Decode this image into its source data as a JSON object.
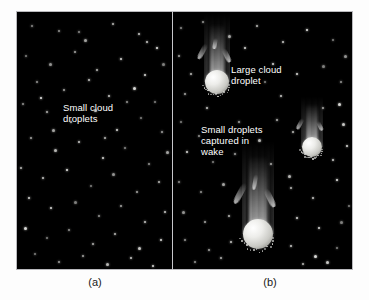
{
  "figure": {
    "background_color": "#fdfdfd",
    "panel_background_color": "#000000",
    "panel_border_color": "#b9b9bd",
    "droplet_color": "#ededea",
    "dot_color": "#e9e9e6",
    "label_color": "#ffffff",
    "caption_color": "#1a1a1a"
  },
  "panel_a": {
    "caption": "(a)",
    "label": "Small cloud\ndroplets",
    "dots": [
      [
        15,
        14
      ],
      [
        42,
        19
      ],
      [
        68,
        28
      ],
      [
        96,
        12
      ],
      [
        122,
        22
      ],
      [
        140,
        36
      ],
      [
        9,
        44
      ],
      [
        33,
        52
      ],
      [
        58,
        40
      ],
      [
        80,
        58
      ],
      [
        104,
        47
      ],
      [
        128,
        63
      ],
      [
        146,
        52
      ],
      [
        20,
        70
      ],
      [
        47,
        78
      ],
      [
        72,
        68
      ],
      [
        92,
        84
      ],
      [
        117,
        76
      ],
      [
        138,
        90
      ],
      [
        6,
        92
      ],
      [
        30,
        100
      ],
      [
        54,
        110
      ],
      [
        78,
        98
      ],
      [
        100,
        118
      ],
      [
        124,
        106
      ],
      [
        145,
        120
      ],
      [
        14,
        126
      ],
      [
        38,
        138
      ],
      [
        62,
        130
      ],
      [
        86,
        146
      ],
      [
        108,
        136
      ],
      [
        132,
        152
      ],
      [
        150,
        140
      ],
      [
        4,
        156
      ],
      [
        26,
        166
      ],
      [
        50,
        158
      ],
      [
        74,
        174
      ],
      [
        96,
        162
      ],
      [
        120,
        180
      ],
      [
        142,
        170
      ],
      [
        12,
        186
      ],
      [
        34,
        196
      ],
      [
        58,
        190
      ],
      [
        82,
        204
      ],
      [
        104,
        194
      ],
      [
        128,
        210
      ],
      [
        148,
        200
      ],
      [
        8,
        216
      ],
      [
        30,
        226
      ],
      [
        52,
        218
      ],
      [
        76,
        232
      ],
      [
        98,
        222
      ],
      [
        122,
        236
      ],
      [
        144,
        228
      ],
      [
        18,
        242
      ],
      [
        42,
        250
      ],
      [
        66,
        244
      ],
      [
        90,
        252
      ],
      [
        114,
        246
      ],
      [
        136,
        254
      ],
      [
        62,
        20
      ],
      [
        110,
        90
      ],
      [
        36,
        118
      ],
      [
        88,
        126
      ],
      [
        130,
        30
      ],
      [
        24,
        86
      ]
    ]
  },
  "panel_b": {
    "caption": "(b)",
    "labels": [
      {
        "text": "Large cloud\ndroplet",
        "x": 58,
        "y": 52
      },
      {
        "text": "Small droplets\ncaptured in\nwake",
        "x": 28,
        "y": 112
      }
    ],
    "droplets": [
      {
        "name": "large-droplet-top",
        "cx": 44,
        "cy": 70,
        "r": 12,
        "wake_height": 56,
        "wake_width": 26
      },
      {
        "name": "large-droplet-right",
        "cx": 139,
        "cy": 135,
        "r": 10,
        "wake_height": 40,
        "wake_width": 22
      },
      {
        "name": "large-droplet-bottom",
        "cx": 85,
        "cy": 222,
        "r": 15,
        "wake_height": 78,
        "wake_width": 32
      }
    ],
    "dots": [
      [
        8,
        16
      ],
      [
        30,
        10
      ],
      [
        56,
        24
      ],
      [
        84,
        14
      ],
      [
        110,
        30
      ],
      [
        134,
        18
      ],
      [
        160,
        28
      ],
      [
        172,
        44
      ],
      [
        6,
        44
      ],
      [
        18,
        62
      ],
      [
        100,
        52
      ],
      [
        124,
        62
      ],
      [
        150,
        54
      ],
      [
        168,
        70
      ],
      [
        12,
        82
      ],
      [
        34,
        96
      ],
      [
        108,
        84
      ],
      [
        166,
        92
      ],
      [
        8,
        110
      ],
      [
        26,
        124
      ],
      [
        104,
        108
      ],
      [
        120,
        120
      ],
      [
        170,
        112
      ],
      [
        14,
        140
      ],
      [
        40,
        150
      ],
      [
        62,
        142
      ],
      [
        98,
        152
      ],
      [
        116,
        164
      ],
      [
        160,
        148
      ],
      [
        174,
        134
      ],
      [
        6,
        170
      ],
      [
        28,
        180
      ],
      [
        50,
        172
      ],
      [
        118,
        176
      ],
      [
        140,
        186
      ],
      [
        164,
        168
      ],
      [
        176,
        194
      ],
      [
        10,
        200
      ],
      [
        32,
        210
      ],
      [
        56,
        204
      ],
      [
        124,
        206
      ],
      [
        146,
        216
      ],
      [
        168,
        210
      ],
      [
        12,
        228
      ],
      [
        36,
        238
      ],
      [
        58,
        230
      ],
      [
        118,
        234
      ],
      [
        142,
        244
      ],
      [
        164,
        236
      ],
      [
        22,
        250
      ],
      [
        48,
        246
      ],
      [
        130,
        252
      ],
      [
        154,
        250
      ],
      [
        72,
        36
      ],
      [
        92,
        70
      ],
      [
        66,
        110
      ],
      [
        150,
        96
      ],
      [
        86,
        128
      ]
    ]
  }
}
